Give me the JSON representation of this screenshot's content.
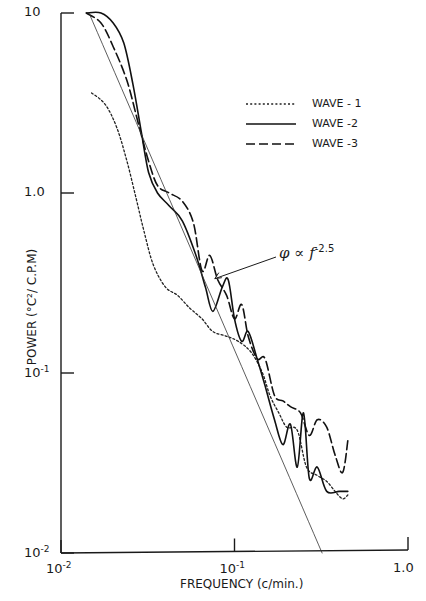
{
  "chart_data": {
    "type": "line",
    "title": "",
    "xlabel": "FREQUENCY (c/min.)",
    "ylabel": "POWER (°C²/ C.P.M)",
    "xscale": "log",
    "yscale": "log",
    "xlim": [
      0.01,
      1.0
    ],
    "ylim": [
      0.01,
      10
    ],
    "x_ticks": [
      {
        "value": 0.01,
        "label_base": "10",
        "label_exp": "-2"
      },
      {
        "value": 0.1,
        "label_base": "10",
        "label_exp": "-1"
      },
      {
        "value": 1.0,
        "label_base": "1.0",
        "label_exp": ""
      }
    ],
    "y_ticks": [
      {
        "value": 10,
        "label_base": "10",
        "label_exp": ""
      },
      {
        "value": 1.0,
        "label_base": "1.0",
        "label_exp": ""
      },
      {
        "value": 0.1,
        "label_base": "10",
        "label_exp": "-1"
      },
      {
        "value": 0.01,
        "label_base": "10",
        "label_exp": "-2"
      }
    ],
    "grid": false,
    "legend_position": "upper right",
    "legend": [
      {
        "name": "WAVE - 1",
        "style": "dotted"
      },
      {
        "name": "WAVE -2",
        "style": "solid"
      },
      {
        "name": "WAVE -3",
        "style": "dashed"
      }
    ],
    "annotation": {
      "text": "φ ∝ f",
      "exponent": "-2.5",
      "points_to": [
        0.075,
        0.33
      ]
    },
    "series": [
      {
        "name": "WAVE - 1",
        "style": "dotted",
        "x": [
          0.015,
          0.018,
          0.021,
          0.024,
          0.027,
          0.03,
          0.034,
          0.04,
          0.047,
          0.055,
          0.065,
          0.075,
          0.09,
          0.105,
          0.125,
          0.145,
          0.16,
          0.18,
          0.2,
          0.23,
          0.26,
          0.3,
          0.34,
          0.38,
          0.42,
          0.45
        ],
        "y": [
          3.6,
          3.1,
          2.3,
          1.5,
          0.95,
          0.62,
          0.4,
          0.3,
          0.27,
          0.23,
          0.2,
          0.17,
          0.16,
          0.15,
          0.13,
          0.1,
          0.075,
          0.06,
          0.05,
          0.048,
          0.03,
          0.027,
          0.025,
          0.022,
          0.02,
          0.021
        ]
      },
      {
        "name": "WAVE -2",
        "style": "solid",
        "x": [
          0.014,
          0.017,
          0.02,
          0.023,
          0.026,
          0.029,
          0.032,
          0.036,
          0.042,
          0.05,
          0.06,
          0.068,
          0.075,
          0.085,
          0.092,
          0.1,
          0.11,
          0.12,
          0.135,
          0.15,
          0.17,
          0.19,
          0.21,
          0.23,
          0.25,
          0.27,
          0.3,
          0.34,
          0.4,
          0.45
        ],
        "y": [
          10,
          10,
          8.8,
          6.8,
          4.0,
          2.2,
          1.3,
          1.0,
          0.85,
          0.7,
          0.45,
          0.3,
          0.22,
          0.3,
          0.33,
          0.2,
          0.15,
          0.17,
          0.12,
          0.085,
          0.055,
          0.04,
          0.052,
          0.03,
          0.06,
          0.026,
          0.03,
          0.022,
          0.022,
          0.022
        ]
      },
      {
        "name": "WAVE -3",
        "style": "dashed",
        "x": [
          0.014,
          0.017,
          0.02,
          0.024,
          0.028,
          0.032,
          0.036,
          0.042,
          0.05,
          0.058,
          0.065,
          0.072,
          0.08,
          0.09,
          0.1,
          0.11,
          0.12,
          0.135,
          0.15,
          0.17,
          0.19,
          0.21,
          0.24,
          0.27,
          0.3,
          0.34,
          0.38,
          0.42,
          0.45
        ],
        "y": [
          10,
          8.8,
          6.5,
          4.2,
          2.4,
          1.5,
          1.1,
          1.0,
          0.9,
          0.68,
          0.37,
          0.45,
          0.33,
          0.27,
          0.2,
          0.24,
          0.16,
          0.12,
          0.12,
          0.075,
          0.07,
          0.065,
          0.06,
          0.045,
          0.055,
          0.05,
          0.035,
          0.028,
          0.042
        ]
      },
      {
        "name": "φ ∝ f^-2.5 reference",
        "style": "thin-solid",
        "x": [
          0.0145,
          0.32
        ],
        "y": [
          10,
          0.01
        ]
      }
    ]
  }
}
